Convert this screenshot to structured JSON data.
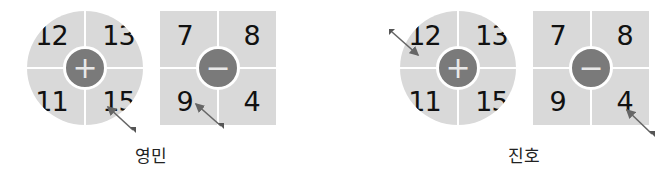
{
  "panels": [
    {
      "name": "영민",
      "add_board": {
        "shape": "circle",
        "operator": "+",
        "numbers": [
          "12",
          "13",
          "11",
          "15"
        ],
        "hit": "15"
      },
      "sub_board": {
        "shape": "square",
        "operator": "−",
        "numbers": [
          "7",
          "8",
          "9",
          "4"
        ],
        "hit": "9"
      }
    },
    {
      "name": "진호",
      "add_board": {
        "shape": "circle",
        "operator": "+",
        "numbers": [
          "12",
          "13",
          "11",
          "15"
        ],
        "hit": "12"
      },
      "sub_board": {
        "shape": "square",
        "operator": "−",
        "numbers": [
          "7",
          "8",
          "9",
          "4"
        ],
        "hit": "4"
      }
    }
  ],
  "colors": {
    "board": "#d9d9d9",
    "disc": "#7a7a7a",
    "arrow": "#666666"
  }
}
